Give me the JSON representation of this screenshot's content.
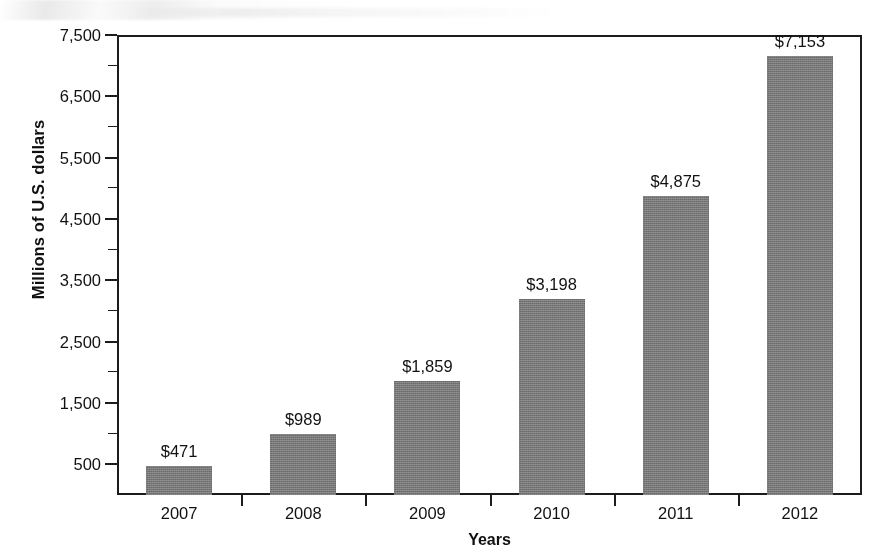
{
  "chart_data": {
    "type": "bar",
    "title": "",
    "xlabel": "Years",
    "ylabel": "Millions of U.S. dollars",
    "categories": [
      "2007",
      "2008",
      "2009",
      "2010",
      "2011",
      "2012"
    ],
    "values": [
      471,
      989,
      1859,
      3198,
      4875,
      7153
    ],
    "data_labels": [
      "$471",
      "$989",
      "$1,859",
      "$3,198",
      "$4,875",
      "$7,153"
    ],
    "ylim": [
      0,
      7500
    ],
    "ytick_labels": [
      "500",
      "1,500",
      "2,500",
      "3,500",
      "4,500",
      "5,500",
      "6,500",
      "7,500"
    ],
    "ytick_values": [
      500,
      1500,
      2500,
      3500,
      4500,
      5500,
      6500,
      7500
    ],
    "yminor_values": [
      1000,
      2000,
      3000,
      4000,
      5000,
      6000,
      7000
    ],
    "grid": false,
    "legend": "none",
    "bar_color": "#7e7e7e",
    "axis_color": "#1c1c1c",
    "text_color": "#111111",
    "background": "#ffffff"
  }
}
